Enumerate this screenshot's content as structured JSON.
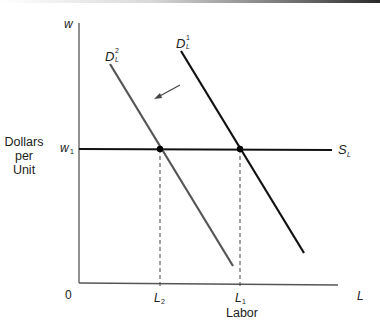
{
  "figure": {
    "type": "labor-market-shift-diagram",
    "y_axis": {
      "symbol": "w",
      "label_lines": [
        "Dollars",
        "per",
        "Unit"
      ],
      "tick": {
        "symbol": "w",
        "subscript": "1"
      }
    },
    "x_axis": {
      "symbol": "L",
      "label": "Labor",
      "origin": "0",
      "ticks": [
        {
          "symbol": "L",
          "subscript": "2"
        },
        {
          "symbol": "L",
          "subscript": "1"
        }
      ]
    },
    "curves": [
      {
        "id": "D1",
        "symbol": "D",
        "subscript": "L",
        "superscript": "1",
        "color": "#111111",
        "role": "original labor demand"
      },
      {
        "id": "D2",
        "symbol": "D",
        "subscript": "L",
        "superscript": "2",
        "color": "#555555",
        "role": "shifted labor demand"
      },
      {
        "id": "SL",
        "symbol": "S",
        "subscript": "L",
        "color": "#111111",
        "role": "horizontal labor supply"
      }
    ],
    "arrow": {
      "direction": "down-left",
      "meaning": "demand shifts from D1 to D2"
    },
    "equilibria": [
      {
        "curve": "D2",
        "wage": "w1",
        "labor": "L2"
      },
      {
        "curve": "D1",
        "wage": "w1",
        "labor": "L1"
      }
    ]
  }
}
